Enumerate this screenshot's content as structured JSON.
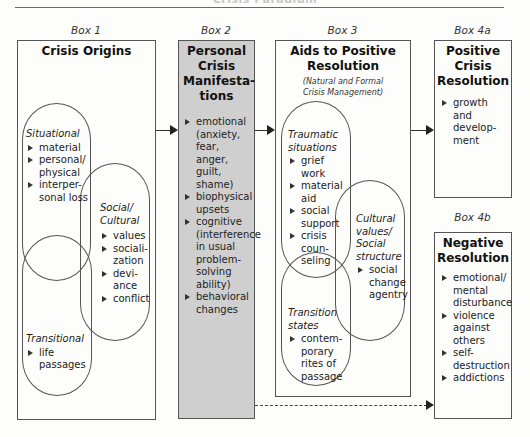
{
  "header": {
    "cut_title": "Crisis Paradigm"
  },
  "box1": {
    "label": "Box 1",
    "title": "Crisis Origins",
    "groups": {
      "situational": {
        "name": "Situational",
        "items": [
          "material",
          "personal/ physical",
          "interper- sonal loss"
        ]
      },
      "social": {
        "name": "Social/ Cultural",
        "items": [
          "values",
          "sociali- zation",
          "devi- ance",
          "conflict"
        ]
      },
      "transitional": {
        "name": "Transitional",
        "items": [
          "life passages"
        ]
      }
    }
  },
  "box2": {
    "label": "Box 2",
    "title": "Personal Crisis Manifesta- tions",
    "items": [
      "emotional (anxiety, fear, anger, guilt, shame)",
      "biophysical upsets",
      "cognitive (interference in usual problem- solving ability)",
      "behavioral changes"
    ],
    "fill_color": "#cfcfcf"
  },
  "box3": {
    "label": "Box 3",
    "title": "Aids to Positive Resolution",
    "subtitle": "(Natural and Formal Crisis Management)",
    "groups": {
      "traumatic": {
        "name": "Traumatic situations",
        "items": [
          "grief work",
          "material aid",
          "social support",
          "crisis coun- seling"
        ]
      },
      "cultural": {
        "name": "Cultural values/ Social structure",
        "items": [
          "social change agentry"
        ]
      },
      "transition": {
        "name": "Transition states",
        "items": [
          "contem- porary rites of passage"
        ]
      }
    }
  },
  "box4a": {
    "label": "Box 4a",
    "title": "Positive Crisis Resolution",
    "items": [
      "growth and develop- ment"
    ]
  },
  "box4b": {
    "label": "Box 4b",
    "title": "Negative Resolution",
    "items": [
      "emotional/ mental disturbance",
      "violence against others",
      "self- destruction",
      "addictions"
    ]
  }
}
